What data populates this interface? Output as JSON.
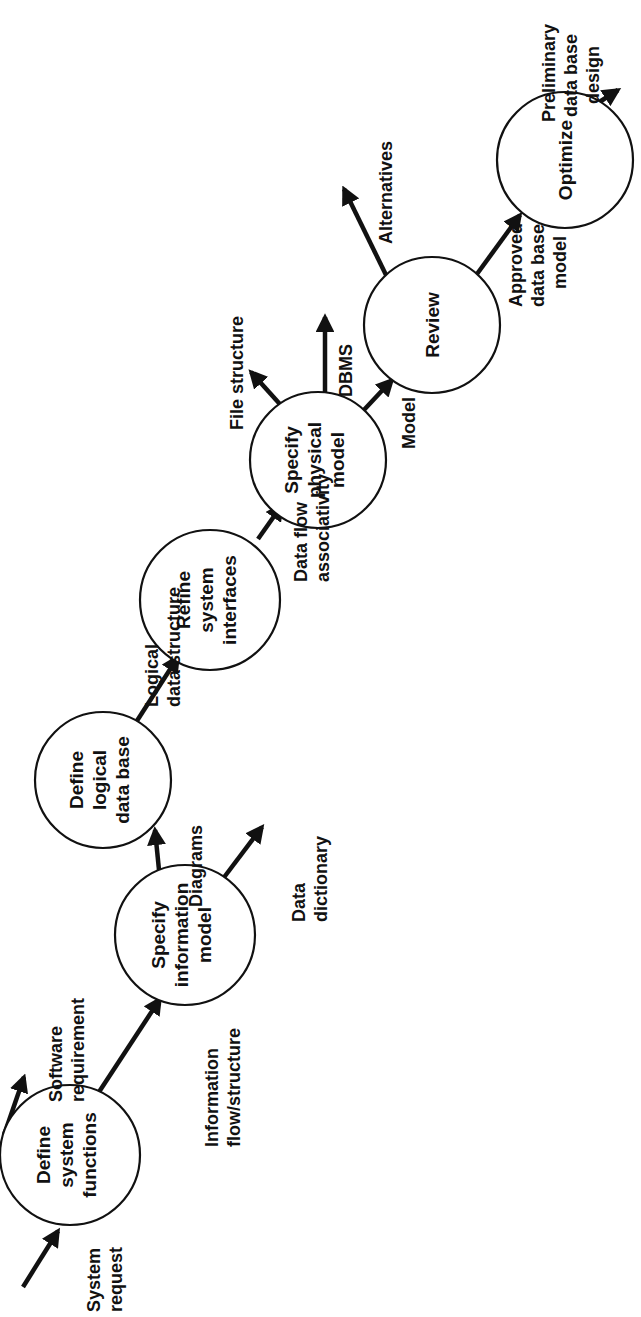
{
  "diagram": {
    "orientation": "rotated-90-ccw",
    "colors": {
      "ink": "#111111",
      "paper": "#ffffff"
    },
    "nodes": [
      {
        "id": "define-system-functions",
        "lines": [
          "Define",
          "system",
          "functions"
        ]
      },
      {
        "id": "specify-information-model",
        "lines": [
          "Specify",
          "information",
          "model"
        ]
      },
      {
        "id": "define-logical-data-base",
        "lines": [
          "Define",
          "logical",
          "data base"
        ]
      },
      {
        "id": "refine-system-interfaces",
        "lines": [
          "Refine",
          "system",
          "interfaces"
        ]
      },
      {
        "id": "specify-physical-model",
        "lines": [
          "Specify",
          "physical",
          "model"
        ]
      },
      {
        "id": "review",
        "lines": [
          "Review"
        ]
      },
      {
        "id": "optimize",
        "lines": [
          "Optimize"
        ]
      }
    ],
    "flows": [
      {
        "id": "system-request",
        "from": "input",
        "to": "define-system-functions",
        "lines": [
          "System",
          "request"
        ]
      },
      {
        "id": "software-requirement",
        "from": "define-system-functions",
        "to": "output",
        "lines": [
          "Software",
          "requirement"
        ]
      },
      {
        "id": "information-flow-structure",
        "from": "define-system-functions",
        "to": "specify-information-model",
        "lines": [
          "Information",
          "flow/structure"
        ]
      },
      {
        "id": "diagrams",
        "from": "specify-information-model",
        "to": "define-logical-data-base",
        "lines": [
          "Diagrams"
        ]
      },
      {
        "id": "data-dictionary",
        "from": "specify-information-model",
        "to": "output",
        "lines": [
          "Data",
          "dictionary"
        ]
      },
      {
        "id": "logical-data-structure",
        "from": "define-logical-data-base",
        "to": "refine-system-interfaces",
        "lines": [
          "Logical",
          "data structure"
        ]
      },
      {
        "id": "data-flow-associativity",
        "from": "refine-system-interfaces",
        "to": "specify-physical-model",
        "lines": [
          "Data flow",
          "associativity"
        ]
      },
      {
        "id": "file-structure",
        "from": "specify-physical-model",
        "to": "output",
        "lines": [
          "File structure"
        ]
      },
      {
        "id": "dbms",
        "from": "specify-physical-model",
        "to": "output",
        "lines": [
          "DBMS"
        ]
      },
      {
        "id": "model",
        "from": "specify-physical-model",
        "to": "review",
        "lines": [
          "Model"
        ]
      },
      {
        "id": "alternatives",
        "from": "review",
        "to": "output",
        "lines": [
          "Alternatives"
        ]
      },
      {
        "id": "approved-data-base-model",
        "from": "review",
        "to": "optimize",
        "lines": [
          "Approved",
          "data base",
          "model"
        ]
      },
      {
        "id": "preliminary-data-base-design",
        "from": "optimize",
        "to": "output",
        "lines": [
          "Preliminary",
          "data base",
          "design"
        ]
      }
    ]
  }
}
